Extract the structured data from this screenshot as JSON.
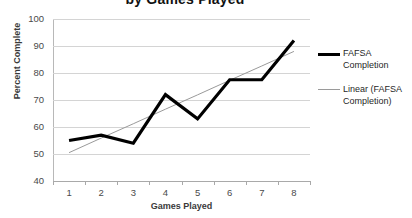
{
  "chart_data": {
    "type": "line",
    "title": "by Games Played",
    "xlabel": "Games Played",
    "ylabel": "Percent Complete",
    "categories": [
      "1",
      "2",
      "3",
      "4",
      "5",
      "6",
      "7",
      "8"
    ],
    "ylim": [
      40,
      100
    ],
    "yticks": [
      "100",
      "90",
      "80",
      "70",
      "60",
      "50",
      "40"
    ],
    "grid": true,
    "legend_position": "right",
    "series": [
      {
        "name": "FAFSA Completion",
        "type": "line",
        "color": "#000000",
        "values": [
          55,
          57,
          54,
          72,
          63,
          77.5,
          77.5,
          92
        ]
      },
      {
        "name": "Linear (FAFSA Completion)",
        "type": "trendline",
        "color": "#9a9a9a",
        "values": [
          50.5,
          55.9,
          61.2,
          66.6,
          71.9,
          77.3,
          82.6,
          88
        ]
      }
    ]
  },
  "legend": {
    "items": [
      {
        "label": "FAFSA Completion",
        "swatch": "thick-black-line"
      },
      {
        "label": "Linear (FAFSA Completion)",
        "swatch": "thin-gray-line"
      }
    ]
  }
}
